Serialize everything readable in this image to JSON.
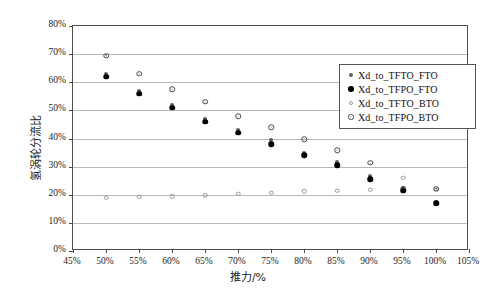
{
  "chart_data": {
    "type": "scatter",
    "title": "",
    "xlabel": "推力/%",
    "ylabel": "氢涡轮分流比",
    "xlim": [
      45,
      105
    ],
    "ylim": [
      0,
      80
    ],
    "xticks": [
      "45%",
      "50%",
      "55%",
      "60%",
      "65%",
      "70%",
      "75%",
      "80%",
      "85%",
      "90%",
      "95%",
      "100%",
      "105%"
    ],
    "yticks": [
      "0%",
      "10%",
      "20%",
      "30%",
      "40%",
      "50%",
      "60%",
      "70%",
      "80%"
    ],
    "grid": "horizontal",
    "legend_position": "upper-right-inside",
    "x": [
      50,
      55,
      60,
      65,
      70,
      75,
      80,
      85,
      90,
      95,
      100
    ],
    "series": [
      {
        "name": "Xd_to_TFTO_FTO",
        "marker": "small-filled-dot",
        "values": [
          63.0,
          57.0,
          52.0,
          47.0,
          43.0,
          39.5,
          35.0,
          31.5,
          26.5,
          22.5,
          17.5
        ]
      },
      {
        "name": "Xd_to_TFPO_FTO",
        "marker": "filled-circle",
        "values": [
          62.0,
          56.0,
          51.0,
          46.0,
          42.0,
          38.0,
          34.0,
          30.5,
          25.5,
          21.5,
          17.0
        ]
      },
      {
        "name": "Xd_to_TFTO_BTO",
        "marker": "small-open-circle",
        "values": [
          19.0,
          19.3,
          19.5,
          19.8,
          20.3,
          20.8,
          21.3,
          21.5,
          21.8,
          26.0,
          21.8
        ]
      },
      {
        "name": "Xd_to_TFPO_BTO",
        "marker": "open-circle-dot",
        "values": [
          69.5,
          63.0,
          57.5,
          53.0,
          48.0,
          44.0,
          39.8,
          35.8,
          31.3,
          22.2,
          22.2
        ]
      }
    ]
  },
  "legend": {
    "items": [
      {
        "label": "Xd_to_TFTO_FTO",
        "marker": "small-filled-dot"
      },
      {
        "label": "Xd_to_TFPO_FTO",
        "marker": "filled-circle"
      },
      {
        "label": "Xd_to_TFTO_BTO",
        "marker": "small-open-circle"
      },
      {
        "label": "Xd_to_TFPO_BTO",
        "marker": "open-circle-dot"
      }
    ]
  },
  "colors": {
    "axis": "#4d4d4d",
    "grid": "#b7b7b7",
    "marker_dark": "#000000",
    "marker_light": "#9a9a9a",
    "background": "#ffffff"
  }
}
